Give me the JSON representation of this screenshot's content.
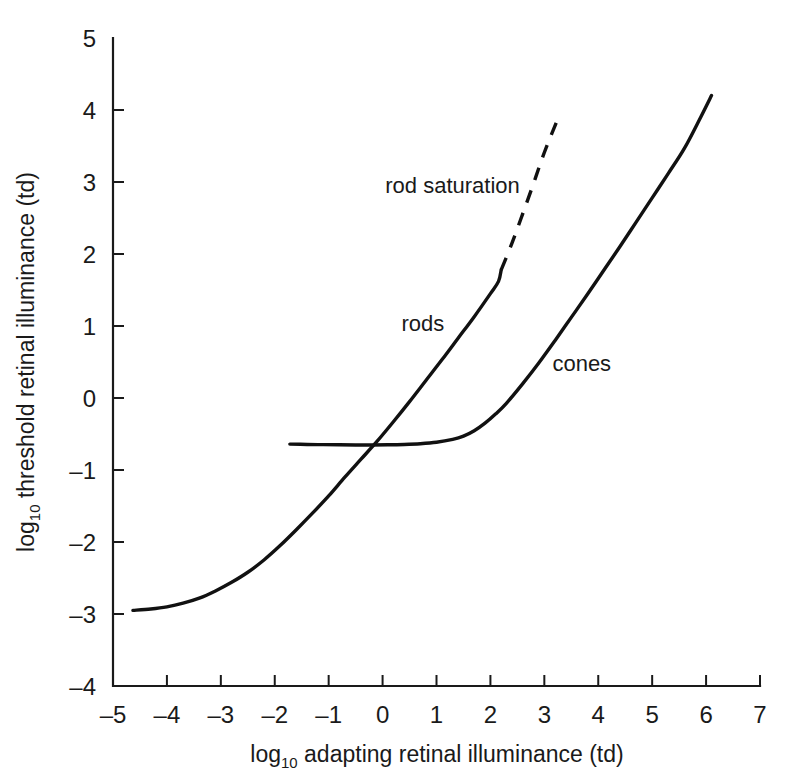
{
  "chart_data": {
    "type": "line",
    "title": "",
    "subtitle": "",
    "xlabel": "log10 adapting retinal illuminance (td)",
    "ylabel": "log10 threshold retinal illuminance (td)",
    "xlabel_parts": {
      "prefix": "log",
      "sub": "10",
      "rest": " adapting retinal illuminance (td)"
    },
    "ylabel_parts": {
      "prefix": "log",
      "sub": "10",
      "rest": " threshold retinal illuminance (td)"
    },
    "xlim": [
      -5,
      7
    ],
    "ylim": [
      -4,
      5
    ],
    "xticks": [
      -5,
      -4,
      -3,
      -2,
      -1,
      0,
      1,
      2,
      3,
      4,
      5,
      6,
      7
    ],
    "yticks": [
      -4,
      -3,
      -2,
      -1,
      0,
      1,
      2,
      3,
      4,
      5
    ],
    "xticklabels": [
      "–5",
      "–4",
      "–3",
      "–2",
      "–1",
      "0",
      "1",
      "2",
      "3",
      "4",
      "5",
      "6",
      "7"
    ],
    "yticklabels": [
      "–4",
      "–3",
      "–2",
      "–1",
      "0",
      "1",
      "2",
      "3",
      "4",
      "5"
    ],
    "grid": false,
    "legend": "inline-annotations",
    "line_color": "#111111",
    "series": [
      {
        "name": "rods",
        "style": "solid",
        "points": [
          [
            -4.63,
            -2.95
          ],
          [
            -4.3,
            -2.93
          ],
          [
            -4.0,
            -2.9
          ],
          [
            -3.7,
            -2.85
          ],
          [
            -3.4,
            -2.78
          ],
          [
            -3.1,
            -2.68
          ],
          [
            -2.8,
            -2.56
          ],
          [
            -2.5,
            -2.42
          ],
          [
            -2.2,
            -2.25
          ],
          [
            -1.9,
            -2.05
          ],
          [
            -1.6,
            -1.83
          ],
          [
            -1.3,
            -1.6
          ],
          [
            -1.0,
            -1.36
          ],
          [
            -0.7,
            -1.1
          ],
          [
            -0.4,
            -0.85
          ],
          [
            -0.1,
            -0.6
          ],
          [
            0.2,
            -0.33
          ],
          [
            0.5,
            -0.05
          ],
          [
            0.8,
            0.24
          ],
          [
            1.1,
            0.53
          ],
          [
            1.4,
            0.83
          ],
          [
            1.7,
            1.13
          ],
          [
            2.0,
            1.45
          ],
          [
            2.15,
            1.62
          ],
          [
            2.2,
            1.78
          ]
        ]
      },
      {
        "name": "rod saturation",
        "style": "dashed",
        "points": [
          [
            2.2,
            1.78
          ],
          [
            2.4,
            2.15
          ],
          [
            2.6,
            2.56
          ],
          [
            2.8,
            2.98
          ],
          [
            3.0,
            3.41
          ],
          [
            3.24,
            3.86
          ]
        ]
      },
      {
        "name": "cones",
        "style": "solid",
        "points": [
          [
            -1.72,
            -0.64
          ],
          [
            -1.4,
            -0.645
          ],
          [
            -1.1,
            -0.648
          ],
          [
            -0.8,
            -0.65
          ],
          [
            -0.5,
            -0.652
          ],
          [
            -0.2,
            -0.652
          ],
          [
            0.1,
            -0.65
          ],
          [
            0.4,
            -0.645
          ],
          [
            0.7,
            -0.635
          ],
          [
            1.0,
            -0.615
          ],
          [
            1.3,
            -0.575
          ],
          [
            1.5,
            -0.53
          ],
          [
            1.7,
            -0.455
          ],
          [
            1.9,
            -0.35
          ],
          [
            2.1,
            -0.22
          ],
          [
            2.3,
            -0.07
          ],
          [
            2.6,
            0.2
          ],
          [
            2.9,
            0.49
          ],
          [
            3.2,
            0.8
          ],
          [
            3.5,
            1.12
          ],
          [
            3.8,
            1.44
          ],
          [
            4.1,
            1.77
          ],
          [
            4.4,
            2.1
          ],
          [
            4.7,
            2.44
          ],
          [
            5.0,
            2.78
          ],
          [
            5.3,
            3.12
          ],
          [
            5.6,
            3.47
          ],
          [
            5.9,
            3.9
          ],
          [
            6.1,
            4.2
          ]
        ]
      }
    ],
    "annotations": [
      {
        "text": "rod saturation",
        "x": 0.05,
        "y": 2.85,
        "anchor": "start"
      },
      {
        "text": "rods",
        "x": 0.35,
        "y": 0.93,
        "anchor": "start"
      },
      {
        "text": "cones",
        "x": 3.15,
        "y": 0.38,
        "anchor": "start"
      }
    ]
  }
}
